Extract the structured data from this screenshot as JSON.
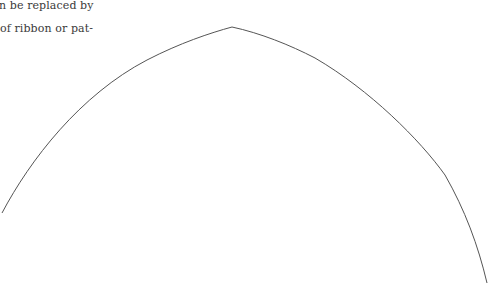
{
  "text": {
    "lines": [
      "n be replaced by",
      "of ribbon or pat-"
    ]
  },
  "figure": {
    "type": "pointed-arch-outline",
    "stroke_color": "#555555",
    "stroke_width": 1,
    "apex": [
      232,
      27
    ],
    "left_end": [
      2,
      213
    ],
    "right_end": [
      487,
      283
    ]
  }
}
